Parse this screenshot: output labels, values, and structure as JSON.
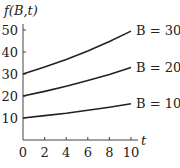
{
  "chart_data": {
    "type": "line",
    "title": "",
    "ylabel": "f(B,t)",
    "xlabel": "t",
    "xlim": [
      0,
      10
    ],
    "ylim": [
      0,
      50
    ],
    "xticks": [
      0,
      2,
      4,
      6,
      8,
      10
    ],
    "yticks": [
      10,
      20,
      30,
      40,
      50
    ],
    "grid": false,
    "legend": "inline labels at right end of curves",
    "x": [
      0,
      2,
      4,
      6,
      8,
      10
    ],
    "series": [
      {
        "name": "B = 30",
        "values": [
          30,
          33.2,
          36.6,
          40.5,
          44.8,
          49.5
        ]
      },
      {
        "name": "B = 20",
        "values": [
          20,
          22.1,
          24.4,
          27.0,
          29.8,
          33.0
        ]
      },
      {
        "name": "B = 10",
        "values": [
          10,
          11.1,
          12.2,
          13.5,
          14.9,
          16.5
        ]
      }
    ]
  },
  "labels": {
    "ylabel": "f(B,t)",
    "xlabel": "t",
    "x_ticks": [
      "0",
      "2",
      "4",
      "6",
      "8",
      "10"
    ],
    "y_ticks": [
      "10",
      "20",
      "30",
      "40",
      "50"
    ],
    "series": [
      "B = 30",
      "B = 20",
      "B = 10"
    ]
  },
  "colors": {
    "line": "#222222",
    "axis": "#444444"
  }
}
